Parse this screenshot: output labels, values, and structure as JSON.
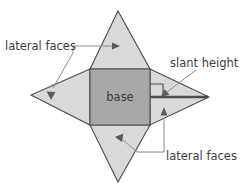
{
  "diagram": {
    "canvas": {
      "width": 240,
      "height": 189
    },
    "background_color": "#ffffff",
    "colors": {
      "base_fill": "#a8a8a8",
      "face_fill": "#d9d9d9",
      "outline": "#4d4d4d",
      "leader": "#8c8c8c",
      "arrow": "#5a5a5a",
      "text": "#3d3d3d"
    },
    "labels": {
      "base": "base",
      "lateral_faces_top": "lateral faces",
      "lateral_faces_bottom": "lateral faces",
      "slant_height": "slant height"
    },
    "shapes": {
      "base_square": {
        "name": "base",
        "points": "90,69 150,69 150,125 90,125"
      },
      "top_triangle": {
        "name": "top-lateral-face",
        "points": "90,69 118,11 150,69"
      },
      "bottom_triangle": {
        "name": "bottom-lateral-face",
        "points": "90,125 118,182 150,125"
      },
      "left_triangle": {
        "name": "left-lateral-face",
        "points": "90,69 31,95 90,125"
      },
      "right_triangle": {
        "name": "right-lateral-face",
        "points": "150,69 209,97 150,125"
      }
    },
    "annotations": {
      "slant_height_segment": {
        "x1": 150,
        "y1": 97,
        "x2": 208,
        "y2": 97
      },
      "right_angle_marker": {
        "points": "150,84 163,84 163,97"
      }
    }
  }
}
